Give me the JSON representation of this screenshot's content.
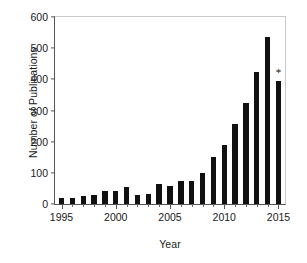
{
  "chart_data": {
    "type": "bar",
    "title": "",
    "xlabel": "Year",
    "ylabel": "Number of Publications",
    "categories": [
      1995,
      1996,
      1997,
      1998,
      1999,
      2000,
      2001,
      2002,
      2003,
      2004,
      2005,
      2006,
      2007,
      2008,
      2009,
      2010,
      2011,
      2012,
      2013,
      2014,
      2015
    ],
    "values": [
      20,
      20,
      25,
      30,
      42,
      42,
      53,
      30,
      31,
      65,
      57,
      73,
      74,
      101,
      150,
      190,
      257,
      325,
      422,
      537,
      394
    ],
    "ylim": [
      0,
      600
    ],
    "xlim": [
      1994.4,
      2015.6
    ],
    "ytick_labels": [
      "0",
      "100",
      "200",
      "300",
      "400",
      "500",
      "600"
    ],
    "ytick_values": [
      0,
      100,
      200,
      300,
      400,
      500,
      600
    ],
    "xtick_labels": [
      "1995",
      "2000",
      "2005",
      "2010",
      "2015"
    ],
    "xtick_values": [
      1995,
      2000,
      2005,
      2010,
      2015
    ],
    "xtick_minor_values": [
      1996,
      1997,
      1998,
      1999,
      2001,
      2002,
      2003,
      2004,
      2006,
      2007,
      2008,
      2009,
      2011,
      2012,
      2013,
      2014
    ],
    "grid": false,
    "legend": null,
    "bar_color": "#111111",
    "annotations": [
      {
        "x": 2015,
        "y": 394,
        "text": "*"
      }
    ]
  }
}
